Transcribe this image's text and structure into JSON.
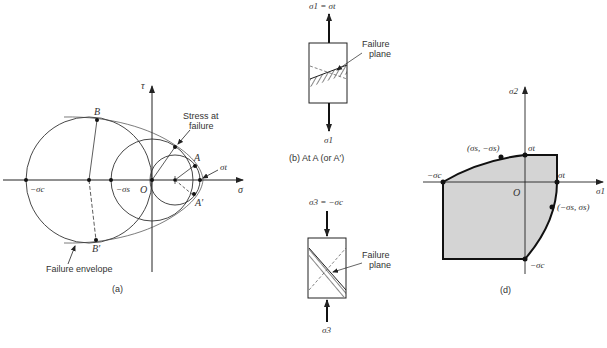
{
  "panel_a": {
    "caption": "(a)",
    "axis_tau": "τ",
    "axis_sigma": "σ",
    "origin": "O",
    "point_neg_sigma_c": "−σc",
    "point_neg_sigma_s": "−σs",
    "point_sigma_t": "σt",
    "point_A": "A",
    "point_A_prime": "A′",
    "point_B": "B",
    "point_B_prime": "B′",
    "annotation_stress_line1": "Stress at",
    "annotation_stress_line2": "failure",
    "annotation_envelope": "Failure envelope"
  },
  "panel_b": {
    "caption": "(b)  At A (or A′)",
    "top_label": "σ1 = σt",
    "bottom_label": "σ1",
    "annotation_line1": "Failure",
    "annotation_line2": "plane"
  },
  "panel_c": {
    "top_label": "σ3 = −σc",
    "bottom_label": "σ3",
    "annotation_line1": "Failure",
    "annotation_line2": "plane"
  },
  "panel_d": {
    "caption": "(d)",
    "axis_sigma1": "σ1",
    "axis_sigma2": "σ2",
    "origin": "O",
    "point_neg_sigma_c_left": "−σc",
    "point_sigma_s_neg_sigma_s": "(σs, −σs)",
    "point_sigma_t_top": "σt",
    "point_sigma_t_right": "σt",
    "point_neg_sigma_s_sigma_s": "(−σs, σs)",
    "point_neg_sigma_c_bottom": "−σc",
    "fill_color": "#d4d4d4"
  }
}
